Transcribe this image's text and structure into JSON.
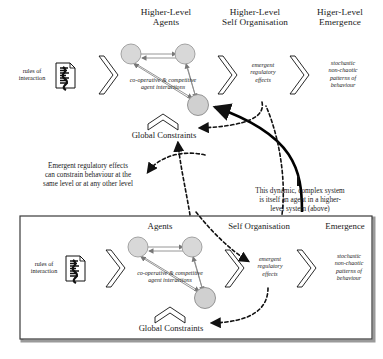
{
  "diagram": {
    "title_hidden": "",
    "upper_level": {
      "headers": [
        {
          "id": "agents",
          "label": "Higher-Level\nAgents"
        },
        {
          "id": "self_org",
          "label": "Higher-Level\nSelf Organisation"
        },
        {
          "id": "emergence",
          "label": "Higer-Level\nEmergence"
        }
      ],
      "input_label": "rules of\ninteraction",
      "agent_network_label": "co-operative & competitive\nagent interactions",
      "global_constraints_label": "Global Constraints",
      "self_org_label": "emergent\nregulatory\neffects",
      "emergence_label": "stochastic\nnon-chaotic\npatterns of\nbehaviour"
    },
    "lower_level": {
      "headers": [
        {
          "id": "agents",
          "label": "Agents"
        },
        {
          "id": "self_org",
          "label": "Self Organisation"
        },
        {
          "id": "emergence",
          "label": "Emergence"
        }
      ],
      "input_label": "rules of\ninteraction",
      "agent_network_label": "co-operative & competitive\nagent interactions",
      "global_constraints_label": "Global Constraints",
      "self_org_label": "emergent\nregulatory\neffects",
      "emergence_label": "stochastic\nnon-chaotic\npatterns of\nbehaviour"
    },
    "annotations": [
      {
        "id": "left",
        "text": "Emergent regulatory effects\ncan constrain behaviour at the\nsame level or at any other level"
      },
      {
        "id": "right",
        "text": "This dynamic, complex system\nis itself an agent in a higher-\nlevel system (above)"
      }
    ],
    "icons": {
      "document": "document-icon",
      "agent_node": "agent-circle-icon",
      "block_arrow": "block-arrow-icon",
      "constraint_arrow": "upward-constraint-arrow-icon"
    },
    "colors": {
      "ink": "#1a1a1a",
      "node_fill": "#d8d8d8",
      "node_stroke": "#808080",
      "box_border": "#3a3a3a",
      "box_shadow": "#9a9a9a"
    }
  }
}
